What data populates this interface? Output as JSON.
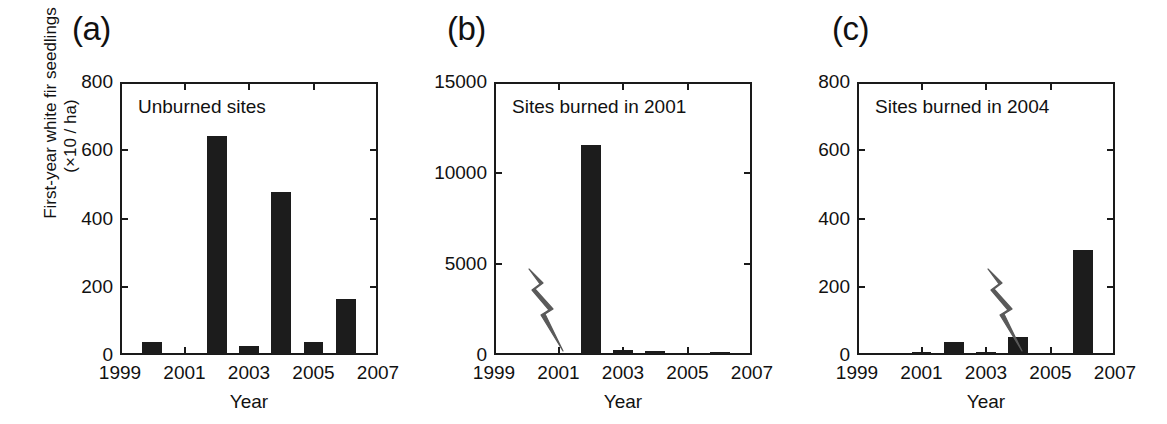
{
  "figure": {
    "y_axis_label_line1": "First-year white fir seedlings",
    "y_axis_label_line2": "(×10 / ha)",
    "x_axis_title": "Year",
    "panel_letters": {
      "a": "(a)",
      "b": "(b)",
      "c": "(c)"
    },
    "bar_color": "#1c1c1c",
    "axis_color": "#1a1a1a",
    "bolt_color": "#5a5a5a"
  },
  "chart_data": [
    {
      "type": "bar",
      "panel": "(a)",
      "title": "Unburned sites",
      "xlabel": "Year",
      "ylabel": "First-year white fir seedlings (×10 / ha)",
      "categories": [
        1999,
        2000,
        2001,
        2002,
        2003,
        2004,
        2005,
        2006,
        2007
      ],
      "values": [
        0,
        35,
        0,
        640,
        22,
        475,
        35,
        160,
        0
      ],
      "xlim": [
        1999,
        2007
      ],
      "ylim": [
        0,
        800
      ],
      "yticks": [
        0,
        200,
        400,
        600,
        800
      ],
      "ytick_labels": [
        "0",
        "200",
        "400",
        "600",
        "800"
      ],
      "xticks": [
        1999,
        2001,
        2003,
        2005,
        2007
      ],
      "xtick_labels": [
        "1999",
        "2001",
        "2003",
        "2005",
        "2007"
      ],
      "grid": false,
      "legend": "none",
      "annotations": []
    },
    {
      "type": "bar",
      "panel": "(b)",
      "title": "Sites burned in 2001",
      "xlabel": "Year",
      "ylabel": "First-year white fir seedlings (×10 / ha)",
      "categories": [
        1999,
        2000,
        2001,
        2002,
        2003,
        2004,
        2005,
        2006,
        2007
      ],
      "values": [
        0,
        0,
        0,
        11500,
        200,
        150,
        0,
        60,
        0
      ],
      "xlim": [
        1999,
        2007
      ],
      "ylim": [
        0,
        15000
      ],
      "yticks": [
        0,
        5000,
        10000,
        15000
      ],
      "ytick_labels": [
        "0",
        "5000",
        "10000",
        "15000"
      ],
      "xticks": [
        1999,
        2001,
        2003,
        2005,
        2007
      ],
      "xtick_labels": [
        "1999",
        "2001",
        "2003",
        "2005",
        "2007"
      ],
      "grid": false,
      "legend": "none",
      "annotations": [
        {
          "type": "lightning-bolt",
          "label": "fire-event-2001",
          "x": 2001,
          "meaning": "fire"
        }
      ]
    },
    {
      "type": "bar",
      "panel": "(c)",
      "title": "Sites burned in 2004",
      "xlabel": "Year",
      "ylabel": "First-year white fir seedlings (×10 / ha)",
      "categories": [
        1999,
        2000,
        2001,
        2002,
        2003,
        2004,
        2005,
        2006,
        2007
      ],
      "values": [
        0,
        0,
        3,
        35,
        4,
        50,
        0,
        305,
        0
      ],
      "xlim": [
        1999,
        2007
      ],
      "ylim": [
        0,
        800
      ],
      "yticks": [
        0,
        200,
        400,
        600,
        800
      ],
      "ytick_labels": [
        "0",
        "200",
        "400",
        "600",
        "800"
      ],
      "xticks": [
        1999,
        2001,
        2003,
        2005,
        2007
      ],
      "xtick_labels": [
        "1999",
        "2001",
        "2003",
        "2005",
        "2007"
      ],
      "grid": false,
      "legend": "none",
      "annotations": [
        {
          "type": "lightning-bolt",
          "label": "fire-event-2004",
          "x": 2004,
          "meaning": "fire"
        }
      ]
    }
  ]
}
